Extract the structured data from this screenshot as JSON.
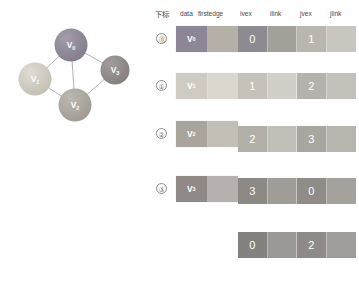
{
  "graph": {
    "nodes": [
      {
        "id": "v0",
        "label": "V",
        "sub": "0",
        "cx": 71,
        "cy": 45,
        "r": 16.5,
        "color": "#8d8696",
        "edge_color": "#7a7383"
      },
      {
        "id": "v1",
        "label": "V",
        "sub": "1",
        "cx": 35,
        "cy": 79,
        "r": 16.5,
        "color": "#cfcac0",
        "edge_color": "#bdb8ae"
      },
      {
        "id": "v2",
        "label": "V",
        "sub": "2",
        "cx": 75,
        "cy": 105,
        "r": 16.5,
        "color": "#a9a49c",
        "edge_color": "#97928a"
      },
      {
        "id": "v3",
        "label": "V",
        "sub": "3",
        "cx": 115,
        "cy": 70,
        "r": 14.5,
        "color": "#8f8a88",
        "edge_color": "#7d7876"
      }
    ],
    "edges": [
      {
        "from": "v0",
        "to": "v1"
      },
      {
        "from": "v0",
        "to": "v2"
      },
      {
        "from": "v0",
        "to": "v3"
      },
      {
        "from": "v1",
        "to": "v2"
      },
      {
        "from": "v2",
        "to": "v3"
      }
    ],
    "edge_line_color": "#a8a8a8"
  },
  "vertex_table": {
    "headers": {
      "index": "下标",
      "data": "data",
      "firstedge": "firstedge"
    },
    "rows": [
      {
        "index": "⓪",
        "label": "V",
        "sub": "0",
        "firstedge": "",
        "data_color": "#8d8696",
        "edge_color": "#b4afa7",
        "top": 26
      },
      {
        "index": "①",
        "label": "V",
        "sub": "1",
        "firstedge": "",
        "data_color": "#cfcbc3",
        "edge_color": "#dbd7cf",
        "top": 73
      },
      {
        "index": "②",
        "label": "V",
        "sub": "2",
        "firstedge": "",
        "data_color": "#a9a49c",
        "edge_color": "#c3bfb7",
        "top": 121
      },
      {
        "index": "③",
        "label": "V",
        "sub": "3",
        "firstedge": "",
        "data_color": "#8f8a88",
        "edge_color": "#b6b1ae",
        "top": 176
      }
    ]
  },
  "edge_table": {
    "headers": {
      "ivex": "ivex",
      "ilink": "ilink",
      "jvex": "jvex",
      "jlink": "jlink"
    },
    "rows": [
      {
        "ivex": "0",
        "ilink": "",
        "jvex": "1",
        "jlink": "",
        "top": 26,
        "colors": [
          "#8d8a92",
          "#a3a09a",
          "#b9b6ae",
          "#c9c6bf"
        ]
      },
      {
        "ivex": "1",
        "ilink": "",
        "jvex": "2",
        "jlink": "",
        "top": 73,
        "colors": [
          "#c6c2ba",
          "#d2cfc8",
          "#b5b2ab",
          "#c4c1ba"
        ]
      },
      {
        "ivex": "2",
        "ilink": "",
        "jvex": "3",
        "jlink": "",
        "top": 126,
        "colors": [
          "#b3b0a9",
          "#c2bfb8",
          "#a9a6a0",
          "#b8b5ae"
        ]
      },
      {
        "ivex": "3",
        "ilink": "",
        "jvex": "0",
        "jlink": "",
        "top": 178,
        "colors": [
          "#8d8a86",
          "#a09d99",
          "#908d89",
          "#a5a29e"
        ]
      },
      {
        "ivex": "0",
        "ilink": "",
        "jvex": "2",
        "jlink": "",
        "top": 232,
        "colors": [
          "#84817f",
          "#9b9896",
          "#8d8a88",
          "#a09d9b"
        ]
      }
    ]
  }
}
